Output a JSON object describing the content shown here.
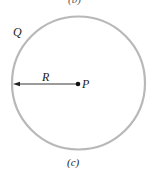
{
  "figure": {
    "caption_top_partial": "(b)",
    "caption": "(c)",
    "labels": {
      "circle_point": "Q",
      "radius": "R",
      "center_point": "P"
    },
    "geometry": {
      "circle_center": [
        78.5,
        83
      ],
      "circle_radius": 66,
      "radius_arrow_from": [
        78,
        84
      ],
      "radius_arrow_to": [
        14,
        84
      ]
    },
    "colors": {
      "circle_stroke": "#b8b8b8",
      "line": "#222222",
      "text": "#222222"
    }
  }
}
